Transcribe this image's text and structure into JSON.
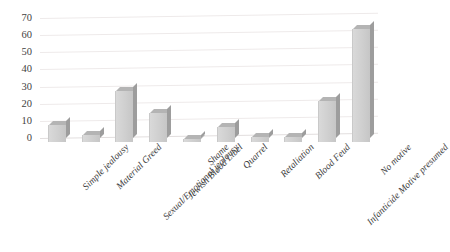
{
  "chart_data": {
    "type": "bar",
    "title": "",
    "subtitle": "",
    "xlabel": "",
    "ylabel": "",
    "ylim": [
      0,
      70
    ],
    "y_ticks": [
      0,
      10,
      20,
      30,
      40,
      50,
      60,
      70
    ],
    "grid": true,
    "legend": false,
    "legend_position": "none",
    "style": "3d-column",
    "bar_color": "#d0d0d0",
    "bar_side_color": "#9d9d9d",
    "bar_top_color": "#b4b4b4",
    "gridline_color": "#eeeaea",
    "text_color": "#3f3f3f",
    "background": "#ffffff",
    "categories": [
      "Simple jealousy",
      "Material Greed",
      "Sexual/Emotional jealousy",
      "Jewish Blood Libel",
      "Shame",
      "Quarrel",
      "Retaliation",
      "Blood Feud",
      "Infanticide Motive presumed",
      "No motive"
    ],
    "values": [
      10,
      4,
      30,
      17,
      2,
      9,
      3,
      3,
      24,
      66
    ],
    "series": [
      {
        "name": "Motive count",
        "values": [
          10,
          4,
          30,
          17,
          2,
          9,
          3,
          3,
          24,
          66
        ]
      }
    ]
  }
}
